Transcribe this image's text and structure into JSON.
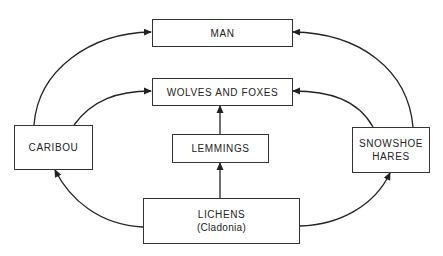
{
  "diagram": {
    "type": "food-web",
    "nodes": [
      {
        "id": "man",
        "label": "MAN"
      },
      {
        "id": "wolves",
        "label": "WOLVES AND FOXES"
      },
      {
        "id": "caribou",
        "label": "CARIBOU"
      },
      {
        "id": "lemmings",
        "label": "LEMMINGS"
      },
      {
        "id": "hares",
        "label_line1": "SNOWSHOE",
        "label_line2": "HARES"
      },
      {
        "id": "lichens",
        "label_line1": "LICHENS",
        "label_line2": "(Cladonia)"
      }
    ],
    "edges": [
      {
        "from": "LICHENS",
        "to": "CARIBOU"
      },
      {
        "from": "LICHENS",
        "to": "LEMMINGS"
      },
      {
        "from": "LICHENS",
        "to": "SNOWSHOE HARES"
      },
      {
        "from": "CARIBOU",
        "to": "MAN"
      },
      {
        "from": "CARIBOU",
        "to": "WOLVES AND FOXES"
      },
      {
        "from": "LEMMINGS",
        "to": "WOLVES AND FOXES"
      },
      {
        "from": "SNOWSHOE HARES",
        "to": "MAN"
      },
      {
        "from": "SNOWSHOE HARES",
        "to": "WOLVES AND FOXES"
      }
    ],
    "colors": {
      "line": "#222222",
      "box_border": "#333333",
      "background": "#ffffff"
    }
  }
}
